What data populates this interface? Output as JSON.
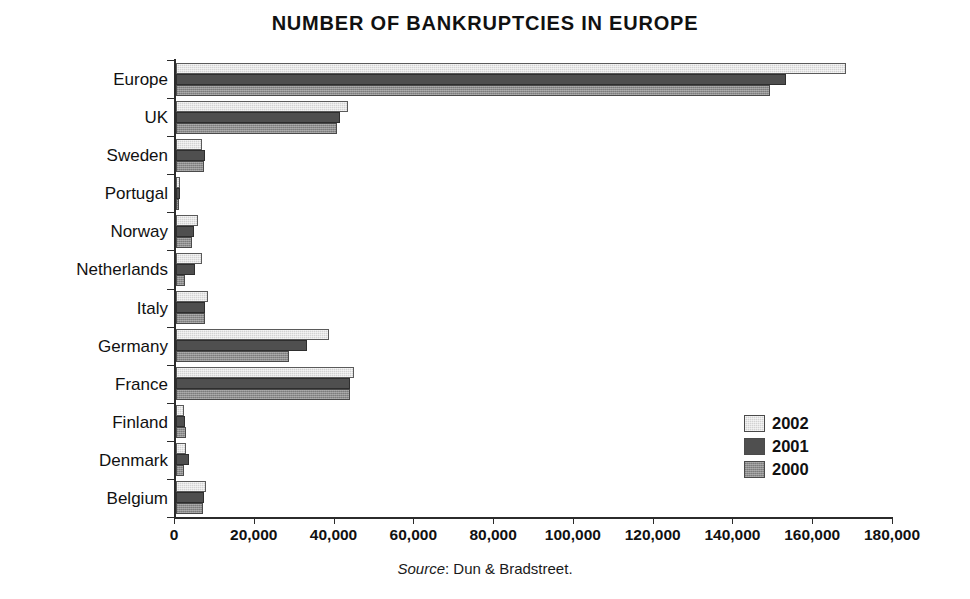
{
  "chart_data": {
    "type": "bar",
    "orientation": "horizontal",
    "title": "NUMBER OF BANKRUPTCIES IN EUROPE",
    "xlabel": "",
    "ylabel": "",
    "xlim": [
      0,
      180000
    ],
    "xticks": [
      0,
      20000,
      40000,
      60000,
      80000,
      100000,
      120000,
      140000,
      160000,
      180000
    ],
    "xtick_labels": [
      "0",
      "20,000",
      "40,000",
      "60,000",
      "80,000",
      "100,000",
      "120,000",
      "140,000",
      "160,000",
      "180,000"
    ],
    "grid": false,
    "legend_position": "center-right",
    "categories": [
      "Europe",
      "UK",
      "Sweden",
      "Portugal",
      "Norway",
      "Netherlands",
      "Italy",
      "Germany",
      "France",
      "Finland",
      "Denmark",
      "Belgium"
    ],
    "series": [
      {
        "name": "2002",
        "color": "#d2d2d2",
        "values": [
          168000,
          43000,
          6500,
          1100,
          5500,
          6500,
          8000,
          38300,
          44600,
          2000,
          2500,
          7400
        ]
      },
      {
        "name": "2001",
        "color": "#4f4f4f",
        "values": [
          153000,
          41000,
          7300,
          900,
          4500,
          4800,
          7300,
          32800,
          43600,
          2200,
          3200,
          7000
        ]
      },
      {
        "name": "2000",
        "color": "#8d8d8d",
        "values": [
          149000,
          40300,
          7000,
          800,
          4000,
          2300,
          7300,
          28300,
          43600,
          2400,
          2000,
          6700
        ]
      }
    ],
    "source_prefix": "Source",
    "source_text": ": Dun & Bradstreet."
  }
}
